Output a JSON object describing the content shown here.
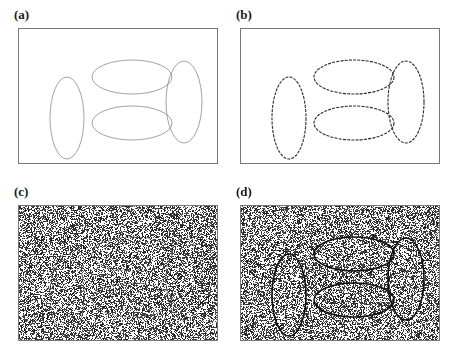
{
  "figure": {
    "type": "multi-panel-figure",
    "background_color": "#ffffff",
    "width": 454,
    "height": 358,
    "panel_count": 4
  },
  "panels": [
    {
      "id": "a",
      "label": "(a)",
      "box": {
        "x": 18,
        "y": 28,
        "width": 200,
        "height": 136
      },
      "label_pos": {
        "x": 14,
        "y": 8
      },
      "border_color": "#777777",
      "background": "#ffffff",
      "noise": false,
      "noise_density": 0,
      "contour_color": "#8a8a8a",
      "contour_width": 0.8,
      "contour_dash": "none",
      "contour_style": "faint-continuous"
    },
    {
      "id": "b",
      "label": "(b)",
      "box": {
        "x": 240,
        "y": 28,
        "width": 200,
        "height": 136
      },
      "label_pos": {
        "x": 236,
        "y": 8
      },
      "border_color": "#777777",
      "background": "#ffffff",
      "noise": false,
      "noise_density": 0,
      "contour_color": "#2a2a2a",
      "contour_width": 1.1,
      "contour_dash": "3 1.2",
      "contour_style": "dark-dashed"
    },
    {
      "id": "c",
      "label": "(c)",
      "box": {
        "x": 18,
        "y": 205,
        "width": 200,
        "height": 136
      },
      "label_pos": {
        "x": 14,
        "y": 185
      },
      "border_color": "#777777",
      "background": "#ffffff",
      "noise": true,
      "noise_density": 0.5,
      "contour_color": "#4a4a4a",
      "contour_width": 0.9,
      "contour_dash": "2.5 1.5",
      "contour_style": "faint-on-noise"
    },
    {
      "id": "d",
      "label": "(d)",
      "box": {
        "x": 240,
        "y": 205,
        "width": 200,
        "height": 136
      },
      "label_pos": {
        "x": 236,
        "y": 185
      },
      "border_color": "#777777",
      "background": "#ffffff",
      "noise": true,
      "noise_density": 0.5,
      "contour_color": "#111111",
      "contour_width": 1.6,
      "contour_dash": "none",
      "contour_style": "strong-on-noise"
    }
  ],
  "ellipses": [
    {
      "name": "left-vertical-ellipse",
      "cx": 48,
      "cy": 89,
      "rx": 17,
      "ry": 41,
      "orientation": "vertical"
    },
    {
      "name": "top-horizontal-ellipse",
      "cx": 113,
      "cy": 48,
      "rx": 40,
      "ry": 17,
      "orientation": "horizontal"
    },
    {
      "name": "bottom-horizontal-ellipse",
      "cx": 113,
      "cy": 94,
      "rx": 40,
      "ry": 17,
      "orientation": "horizontal"
    },
    {
      "name": "right-vertical-ellipse",
      "cx": 165,
      "cy": 73,
      "rx": 18,
      "ry": 41,
      "orientation": "vertical"
    }
  ],
  "noise": {
    "seed": 20240517,
    "dot_color": "#303030",
    "dot_size": 1,
    "density": 0.5,
    "description": "random binary pixel noise (salt-and-pepper) filling the panel"
  }
}
